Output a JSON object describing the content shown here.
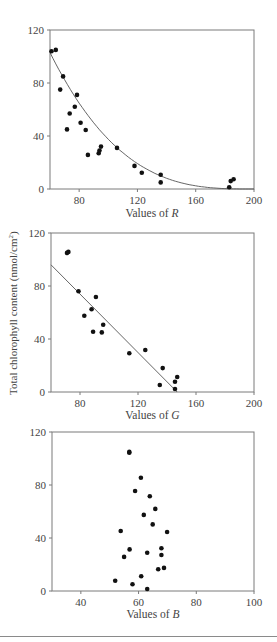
{
  "figure": {
    "ylabel_shared": "Total chlorophyll content (nmol/cm²)",
    "ylabel_main": "Total chlorophyll content (nmol/cm",
    "ylabel_sup": "2",
    "ylabel_close": ")"
  },
  "chart_data": [
    {
      "type": "scatter",
      "title": "",
      "xlabel_prefix": "Values of ",
      "xlabel_var": "R",
      "ylabel": "",
      "xlim": [
        60,
        200
      ],
      "ylim": [
        0,
        120
      ],
      "xticks": [
        80,
        120,
        160,
        200
      ],
      "yticks": [
        0,
        40,
        80,
        120
      ],
      "grid": false,
      "legend": null,
      "fit": {
        "type": "curve",
        "description": "decaying fit",
        "formula": "y = 103 * ((200 - x)/140)^3"
      },
      "points": [
        {
          "x": 61,
          "y": 104
        },
        {
          "x": 64,
          "y": 105
        },
        {
          "x": 69,
          "y": 85
        },
        {
          "x": 67,
          "y": 75
        },
        {
          "x": 78.5,
          "y": 71
        },
        {
          "x": 77,
          "y": 62
        },
        {
          "x": 73.5,
          "y": 57
        },
        {
          "x": 71.7,
          "y": 45
        },
        {
          "x": 81,
          "y": 50
        },
        {
          "x": 84.5,
          "y": 44.5
        },
        {
          "x": 86,
          "y": 25.7
        },
        {
          "x": 93.4,
          "y": 27
        },
        {
          "x": 94,
          "y": 29
        },
        {
          "x": 95,
          "y": 32
        },
        {
          "x": 106,
          "y": 31
        },
        {
          "x": 118,
          "y": 17.4
        },
        {
          "x": 123,
          "y": 12.3
        },
        {
          "x": 136,
          "y": 10.8
        },
        {
          "x": 136,
          "y": 5
        },
        {
          "x": 183,
          "y": 1.3
        },
        {
          "x": 184,
          "y": 6
        },
        {
          "x": 186,
          "y": 7.3
        }
      ]
    },
    {
      "type": "scatter",
      "title": "",
      "xlabel_prefix": "Values of ",
      "xlabel_var": "G",
      "ylabel": "Total chlorophyll content (nmol/cm²)",
      "xlim": [
        60,
        200
      ],
      "ylim": [
        0,
        120
      ],
      "xticks": [
        80,
        120,
        160,
        200
      ],
      "yticks": [
        0,
        40,
        80,
        120
      ],
      "grid": false,
      "legend": null,
      "fit": {
        "type": "line",
        "x0": 60,
        "y0": 96,
        "x1": 147,
        "y1": 0
      },
      "points": [
        {
          "x": 71,
          "y": 105
        },
        {
          "x": 72,
          "y": 105.7
        },
        {
          "x": 79,
          "y": 76
        },
        {
          "x": 91,
          "y": 71.7
        },
        {
          "x": 88,
          "y": 62.4
        },
        {
          "x": 83,
          "y": 57.6
        },
        {
          "x": 96,
          "y": 50.8
        },
        {
          "x": 89,
          "y": 45.5
        },
        {
          "x": 95,
          "y": 45
        },
        {
          "x": 114,
          "y": 29.2
        },
        {
          "x": 125,
          "y": 31.7
        },
        {
          "x": 137,
          "y": 18
        },
        {
          "x": 135,
          "y": 5.3
        },
        {
          "x": 145.5,
          "y": 7.8
        },
        {
          "x": 147,
          "y": 11.3
        },
        {
          "x": 145.5,
          "y": 2.3
        }
      ]
    },
    {
      "type": "scatter",
      "title": "",
      "xlabel_prefix": "Values of ",
      "xlabel_var": "B",
      "ylabel": "",
      "xlim": [
        30,
        100
      ],
      "ylim": [
        0,
        120
      ],
      "xticks": [
        40,
        60,
        80,
        100
      ],
      "yticks": [
        0,
        40,
        80,
        120
      ],
      "grid": false,
      "legend": null,
      "fit": null,
      "points": [
        {
          "x": 56.8,
          "y": 105
        },
        {
          "x": 56.8,
          "y": 104.4
        },
        {
          "x": 60.8,
          "y": 85.5
        },
        {
          "x": 58.8,
          "y": 75.5
        },
        {
          "x": 63.9,
          "y": 71.5
        },
        {
          "x": 65.8,
          "y": 62
        },
        {
          "x": 61.8,
          "y": 57.4
        },
        {
          "x": 64.9,
          "y": 50.3
        },
        {
          "x": 53.8,
          "y": 45.3
        },
        {
          "x": 69.9,
          "y": 44.5
        },
        {
          "x": 56.9,
          "y": 31.4
        },
        {
          "x": 67.9,
          "y": 32.2
        },
        {
          "x": 63,
          "y": 28.9
        },
        {
          "x": 67.9,
          "y": 27.2
        },
        {
          "x": 55,
          "y": 25.7
        },
        {
          "x": 66.8,
          "y": 16.4
        },
        {
          "x": 68.8,
          "y": 17.4
        },
        {
          "x": 51.9,
          "y": 7.8
        },
        {
          "x": 60.9,
          "y": 11.1
        },
        {
          "x": 57.9,
          "y": 5.1
        },
        {
          "x": 63,
          "y": 1.5
        }
      ]
    }
  ],
  "style": {
    "axis_color": "#7a7a7a",
    "point_color": "#111111",
    "fit_color": "#555555",
    "separator_color": "#8a8a8a"
  }
}
